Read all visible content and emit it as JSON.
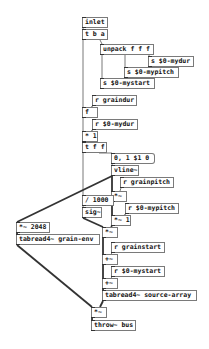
{
  "patch": {
    "objects": [
      {
        "id": "inlet",
        "text": "inlet",
        "x": 82,
        "y": 17,
        "w": 20
      },
      {
        "id": "t-b-a",
        "text": "t b a",
        "x": 82,
        "y": 29,
        "w": 20
      },
      {
        "id": "unpack",
        "text": "unpack f f f",
        "x": 100,
        "y": 44,
        "w": 48
      },
      {
        "id": "s-mydur",
        "text": "s $0-mydur",
        "x": 148,
        "y": 56,
        "w": 40
      },
      {
        "id": "s-mypitch",
        "text": "s $0-mypitch",
        "x": 124,
        "y": 67,
        "w": 49
      },
      {
        "id": "s-mystart",
        "text": "s $0-mystart",
        "x": 100,
        "y": 78,
        "w": 49
      },
      {
        "id": "r-graindur",
        "text": "r graindur",
        "x": 92,
        "y": 95,
        "w": 39
      },
      {
        "id": "f",
        "text": "f",
        "x": 82,
        "y": 107,
        "w": 10
      },
      {
        "id": "r-mydur",
        "text": "r $0-mydur",
        "x": 92,
        "y": 119,
        "w": 40
      },
      {
        "id": "mul-1",
        "text": "* 1",
        "x": 82,
        "y": 131,
        "w": 10
      },
      {
        "id": "t-f-f",
        "text": "t f f",
        "x": 82,
        "y": 142,
        "w": 19
      },
      {
        "id": "msg-vline",
        "text": "0, 1 $1 0",
        "x": 111,
        "y": 153,
        "w": 36,
        "type": "msg"
      },
      {
        "id": "vline",
        "text": "vline~",
        "x": 111,
        "y": 165,
        "w": 22
      },
      {
        "id": "r-grainpitch",
        "text": "r grainpitch",
        "x": 120,
        "y": 177,
        "w": 48
      },
      {
        "id": "mul-sig-pitch",
        "text": "*~",
        "x": 111,
        "y": 191,
        "w": 10
      },
      {
        "id": "div-1000",
        "text": "/ 1000",
        "x": 82,
        "y": 195,
        "w": 26
      },
      {
        "id": "r-mypitch",
        "text": "r $0-mypitch",
        "x": 125,
        "y": 203,
        "w": 48
      },
      {
        "id": "sig",
        "text": "sig~",
        "x": 82,
        "y": 207,
        "w": 14
      },
      {
        "id": "mul-sig-1",
        "text": "*~ 1",
        "x": 111,
        "y": 215,
        "w": 14
      },
      {
        "id": "mul-2048",
        "text": "*~ 2048",
        "x": 16,
        "y": 222,
        "w": 28
      },
      {
        "id": "mul-sig-env",
        "text": "*~",
        "x": 102,
        "y": 227,
        "w": 10
      },
      {
        "id": "tabread-env",
        "text": "tabread4~ grain-env",
        "x": 16,
        "y": 234,
        "w": 78
      },
      {
        "id": "r-grainstart",
        "text": "r grainstart",
        "x": 111,
        "y": 242,
        "w": 48
      },
      {
        "id": "add-1",
        "text": "+~",
        "x": 102,
        "y": 254,
        "w": 10
      },
      {
        "id": "r-mystart",
        "text": "r $0-mystart",
        "x": 111,
        "y": 266,
        "w": 48
      },
      {
        "id": "add-2",
        "text": "+~",
        "x": 102,
        "y": 278,
        "w": 10
      },
      {
        "id": "tabread-src",
        "text": "tabread4~ source-array",
        "x": 102,
        "y": 290,
        "w": 89
      },
      {
        "id": "mul-out",
        "text": "*~",
        "x": 91,
        "y": 307,
        "w": 10
      },
      {
        "id": "throw",
        "text": "throw~ bus",
        "x": 91,
        "y": 320,
        "w": 39
      }
    ],
    "wires": [
      {
        "from": [
          83,
          28
        ],
        "to": [
          83,
          29
        ],
        "signal": false
      },
      {
        "from": [
          100,
          40
        ],
        "to": [
          102,
          44
        ],
        "signal": false
      },
      {
        "from": [
          83,
          40
        ],
        "to": [
          83,
          107
        ],
        "signal": false
      },
      {
        "from": [
          102,
          55
        ],
        "to": [
          102,
          78
        ],
        "signal": false
      },
      {
        "from": [
          125,
          55
        ],
        "to": [
          125,
          67
        ],
        "signal": false
      },
      {
        "from": [
          149,
          55
        ],
        "to": [
          149,
          56
        ],
        "signal": false
      },
      {
        "from": [
          93,
          106
        ],
        "to": [
          91,
          107
        ],
        "signal": false
      },
      {
        "from": [
          83,
          118
        ],
        "to": [
          83,
          131
        ],
        "signal": false
      },
      {
        "from": [
          93,
          130
        ],
        "to": [
          91,
          131
        ],
        "signal": false
      },
      {
        "from": [
          83,
          142
        ],
        "to": [
          83,
          142
        ],
        "signal": false
      },
      {
        "from": [
          99,
          153
        ],
        "to": [
          112,
          153
        ],
        "signal": false
      },
      {
        "from": [
          112,
          164
        ],
        "to": [
          112,
          165
        ],
        "signal": false
      },
      {
        "from": [
          83,
          153
        ],
        "to": [
          83,
          195
        ],
        "signal": false
      },
      {
        "from": [
          83,
          206
        ],
        "to": [
          83,
          207
        ],
        "signal": false
      },
      {
        "from": [
          112,
          176
        ],
        "to": [
          112,
          191
        ],
        "signal": true
      },
      {
        "from": [
          112,
          176
        ],
        "to": [
          17,
          222
        ],
        "signal": true
      },
      {
        "from": [
          121,
          188
        ],
        "to": [
          120,
          191
        ],
        "signal": false
      },
      {
        "from": [
          112,
          202
        ],
        "to": [
          112,
          215
        ],
        "signal": true
      },
      {
        "from": [
          126,
          214
        ],
        "to": [
          124,
          215
        ],
        "signal": false
      },
      {
        "from": [
          83,
          218
        ],
        "to": [
          103,
          227
        ],
        "signal": true
      },
      {
        "from": [
          112,
          226
        ],
        "to": [
          111,
          227
        ],
        "signal": true
      },
      {
        "from": [
          17,
          233
        ],
        "to": [
          17,
          234
        ],
        "signal": true
      },
      {
        "from": [
          103,
          238
        ],
        "to": [
          103,
          254
        ],
        "signal": true
      },
      {
        "from": [
          112,
          253
        ],
        "to": [
          111,
          254
        ],
        "signal": false
      },
      {
        "from": [
          103,
          265
        ],
        "to": [
          103,
          278
        ],
        "signal": true
      },
      {
        "from": [
          112,
          277
        ],
        "to": [
          111,
          278
        ],
        "signal": false
      },
      {
        "from": [
          103,
          289
        ],
        "to": [
          103,
          290
        ],
        "signal": true
      },
      {
        "from": [
          17,
          245
        ],
        "to": [
          92,
          307
        ],
        "signal": true
      },
      {
        "from": [
          103,
          301
        ],
        "to": [
          100,
          307
        ],
        "signal": true
      },
      {
        "from": [
          92,
          318
        ],
        "to": [
          92,
          320
        ],
        "signal": true
      }
    ]
  }
}
